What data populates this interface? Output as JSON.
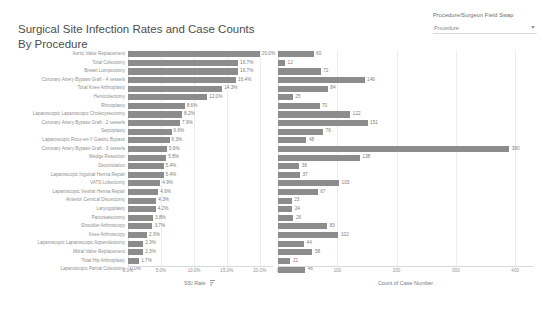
{
  "header": {
    "title_line1": "Surgical Site Infection Rates and Case Counts",
    "title_line2": "By Procedure"
  },
  "filter": {
    "label": "Procedure/Surgeon Field Swap",
    "selected": "Procedure",
    "caret_icon": "chevron-down-icon"
  },
  "chart_data": {
    "type": "bar",
    "title": "Surgical Site Infection Rates and Case Counts By Procedure",
    "orientation": "horizontal",
    "panels": [
      {
        "name": "ssi-rate",
        "xlabel": "SSI Rate",
        "sort_indicator": "descending-sort-icon",
        "unit": "percent",
        "xlim": [
          0,
          0.22
        ],
        "ticks": [
          "0.0%",
          "5.0%",
          "10.0%",
          "15.0%",
          "20.0%"
        ],
        "tick_values": [
          0,
          5,
          10,
          15,
          20
        ]
      },
      {
        "name": "case-count",
        "xlabel": "Count of Case Number",
        "unit": "cases",
        "xlim": [
          0,
          430
        ],
        "ticks": [
          "0",
          "100",
          "200",
          "300",
          "400"
        ],
        "tick_values": [
          0,
          100,
          200,
          300,
          400
        ]
      }
    ],
    "categories": [
      "Aortic Valve Replacement",
      "Total Colectomy",
      "Breast Lumpectomy",
      "Coronary Artery Bypass Graft - 4 vessels",
      "Total Knee Arthroplasty",
      "Hemicolectomy",
      "Rhinoplasty",
      "Laparoscopic Laparoscopic Cholecystectomy",
      "Coronary Artery Bypass Graft - 2 vessels",
      "Septoplasty",
      "Laparoscopic Roux-en-Y Gastric Bypass",
      "Coronary Artery Bypass Graft - 3 vessels",
      "Wedge Resection",
      "Decortication",
      "Laparoscopic Inguinal Hernia Repair",
      "VATS Lobectomy",
      "Laparoscopic Ventral Hernia Repair",
      "Anterior Cervical Discectomy",
      "Laryngoplasty",
      "Pancreatectomy",
      "Shoulder Arthroscopy",
      "Knee Arthroscopy",
      "Laparoscopic Laparoscopic Appendectomy",
      "Mitral Valve Replacement",
      "Total Hip Arthroplasty",
      "Laparoscopic Partial Colectomy"
    ],
    "series": [
      {
        "name": "SSI Rate",
        "panel": "ssi-rate",
        "labels": [
          "20.0%",
          "16.7%",
          "16.7%",
          "16.4%",
          "14.3%",
          "12.0%",
          "8.6%",
          "8.2%",
          "7.9%",
          "6.6%",
          "6.3%",
          "5.9%",
          "5.8%",
          "5.4%",
          "5.4%",
          "4.9%",
          "4.6%",
          "4.3%",
          "4.2%",
          "3.8%",
          "3.7%",
          "2.9%",
          "2.3%",
          "2.3%",
          "1.7%",
          "0.0%"
        ],
        "values": [
          20.0,
          16.7,
          16.7,
          16.4,
          14.3,
          12.0,
          8.6,
          8.2,
          7.9,
          6.6,
          6.3,
          5.9,
          5.8,
          5.4,
          5.4,
          4.9,
          4.6,
          4.3,
          4.2,
          3.8,
          3.7,
          2.9,
          2.3,
          2.3,
          1.7,
          0.0
        ]
      },
      {
        "name": "Count of Case Number",
        "panel": "case-count",
        "labels": [
          "60",
          "12",
          "72",
          "146",
          "84",
          "25",
          "70",
          "122",
          "151",
          "76",
          "48",
          "390",
          "138",
          "36",
          "37",
          "103",
          "67",
          "23",
          "24",
          "26",
          "83",
          "102",
          "44",
          "58",
          "21",
          "46"
        ],
        "values": [
          60,
          12,
          72,
          146,
          84,
          25,
          70,
          122,
          151,
          76,
          48,
          390,
          138,
          36,
          37,
          103,
          67,
          23,
          24,
          26,
          83,
          102,
          44,
          58,
          21,
          46
        ]
      }
    ],
    "colors": {
      "bar": "#8c8c8c",
      "grid": "#ededed",
      "axis": "#d9d9d9",
      "label_text": "#8f8f8f"
    },
    "legend": null,
    "grid": true
  }
}
